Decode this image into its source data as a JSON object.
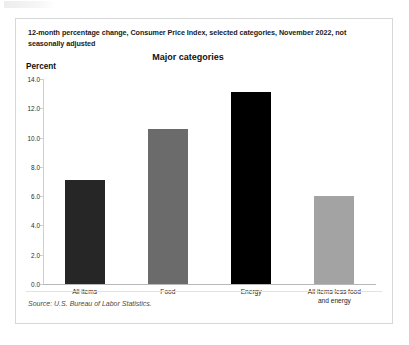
{
  "card": {
    "headline": "12-month percentage change, Consumer Price Index, selected categories, November 2022, not seasonally adjusted",
    "source": "Source: U.S. Bureau of Labor Statistics."
  },
  "colors": {
    "bar_all_items": "#262626",
    "bar_food": "#6b6b6b",
    "bar_energy": "#000000",
    "bar_core": "#a3a3a3",
    "axis": "#b8b8b8",
    "card_border": "#d8d8d8"
  },
  "chart_data": {
    "type": "bar",
    "title": "Major categories",
    "xlabel": "",
    "ylabel": "Percent",
    "ylim": [
      0,
      14
    ],
    "ytick_step": 2,
    "grid": false,
    "legend": false,
    "categories": [
      "All items",
      "Food",
      "Energy",
      "All items less food and energy"
    ],
    "category_lines": [
      [
        "All items"
      ],
      [
        "Food"
      ],
      [
        "Energy"
      ],
      [
        "All items less food",
        "and energy"
      ]
    ],
    "values": [
      7.1,
      10.6,
      13.1,
      6.0
    ],
    "bar_colors": [
      "#262626",
      "#6b6b6b",
      "#000000",
      "#a3a3a3"
    ],
    "ytick_labels": [
      "0.0",
      "2.0",
      "4.0",
      "6.0",
      "8.0",
      "10.0",
      "12.0",
      "14.0"
    ],
    "ytick_values": [
      0,
      2,
      4,
      6,
      8,
      10,
      12,
      14
    ]
  }
}
